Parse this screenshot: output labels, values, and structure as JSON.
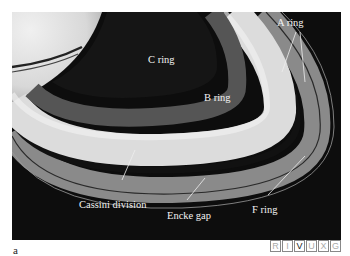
{
  "figure": {
    "panel_letter": "a",
    "labels": {
      "a_ring": "A ring",
      "b_ring": "B ring",
      "c_ring": "C ring",
      "cassini_division": "Cassini division",
      "encke_gap": "Encke gap",
      "f_ring": "F ring"
    },
    "wavelength_bar": [
      {
        "letter": "R",
        "state": "off"
      },
      {
        "letter": "I",
        "state": "off"
      },
      {
        "letter": "V",
        "state": "on"
      },
      {
        "letter": "U",
        "state": "off"
      },
      {
        "letter": "X",
        "state": "off"
      },
      {
        "letter": "G",
        "state": "off"
      }
    ],
    "colors": {
      "background": "#0d0d0d",
      "ring_light": "#e6e6e6",
      "ring_mid": "#a8a8a8",
      "label_text": "#f2f2f2"
    }
  }
}
